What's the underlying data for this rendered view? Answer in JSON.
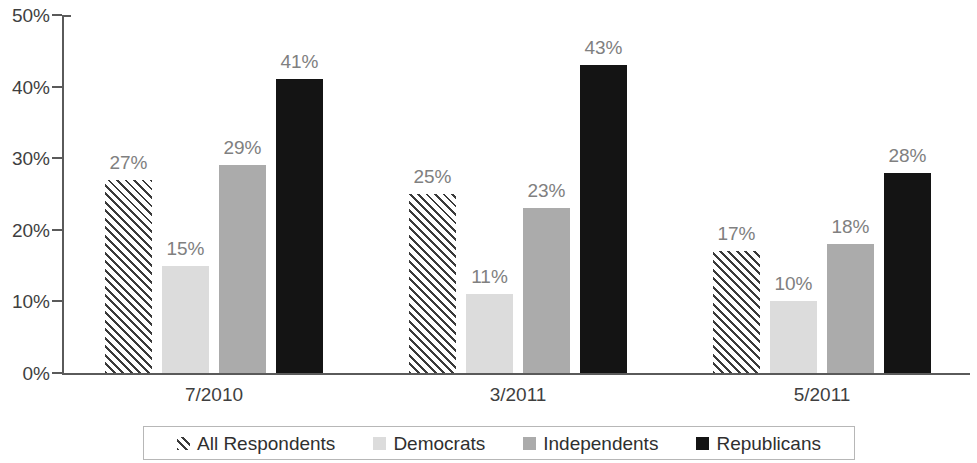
{
  "chart_data": {
    "type": "bar",
    "title": "",
    "subtitle": "",
    "xlabel": "",
    "ylabel": "",
    "ylim": [
      0,
      50
    ],
    "ytick_labels": [
      "0%",
      "10%",
      "20%",
      "30%",
      "40%",
      "50%"
    ],
    "ytick_values": [
      0,
      10,
      20,
      30,
      40,
      50
    ],
    "grid": false,
    "legend_position": "bottom",
    "value_suffix": "%",
    "categories": [
      "7/2010",
      "3/2011",
      "5/2011"
    ],
    "series": [
      {
        "name": "All Respondents",
        "style": "hatch-diagonal",
        "color": "#3a3a3a",
        "values": [
          27,
          25,
          17
        ],
        "labels": [
          "27%",
          "25%",
          "17%"
        ]
      },
      {
        "name": "Democrats",
        "style": "solid",
        "color": "#dcdcdc",
        "values": [
          15,
          11,
          10
        ],
        "labels": [
          "15%",
          "11%",
          "10%"
        ]
      },
      {
        "name": "Independents",
        "style": "solid",
        "color": "#ababab",
        "values": [
          23,
          23,
          18
        ],
        "labels": [
          "29%",
          "23%",
          "18%"
        ]
      },
      {
        "name": "Republicans",
        "style": "solid",
        "color": "#141414",
        "values": [
          41,
          43,
          28
        ],
        "labels": [
          "41%",
          "43%",
          "28%"
        ]
      }
    ],
    "axis_color": "#5a5a5a",
    "label_color": "#808080",
    "tick_color": "#3f3f3f"
  }
}
